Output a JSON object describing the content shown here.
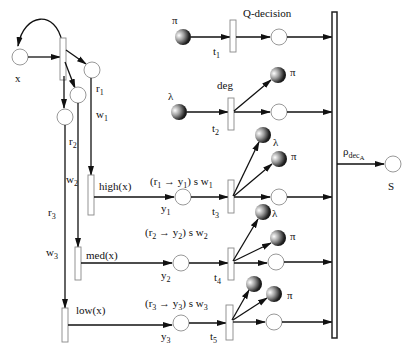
{
  "diagram": {
    "type": "petri-net",
    "nodes": {
      "x": "x",
      "S": "S",
      "r1": "r",
      "r1_sub": "1",
      "w1": "w",
      "w1_sub": "1",
      "r2": "r",
      "r2_sub": "2",
      "w2": "w",
      "w2_sub": "2",
      "r3": "r",
      "r3_sub": "3",
      "w3": "w",
      "w3_sub": "3",
      "y1": "y",
      "y1_sub": "1",
      "y2": "y",
      "y2_sub": "2",
      "y3": "y",
      "y3_sub": "3"
    },
    "transitions": {
      "t1": "t",
      "t1_sub": "1",
      "t2": "t",
      "t2_sub": "2",
      "t3": "t",
      "t3_sub": "3",
      "t4": "t",
      "t4_sub": "4",
      "t5": "t",
      "t5_sub": "5",
      "high": "high(x)",
      "med": "med(x)",
      "low": "low(x)",
      "rho": "ρ",
      "rho_sub": "dec",
      "rho_subsub": "A"
    },
    "labels": {
      "q_decision": "Q-decision",
      "deg": "deg",
      "rule1": "(r₁ → y₁) s w₁",
      "rule2": "(r₂ → y₂) s w₂",
      "rule3": "(r₃ → y₃) s w₃"
    },
    "tokens": {
      "pi": "π",
      "lambda": "λ"
    }
  }
}
